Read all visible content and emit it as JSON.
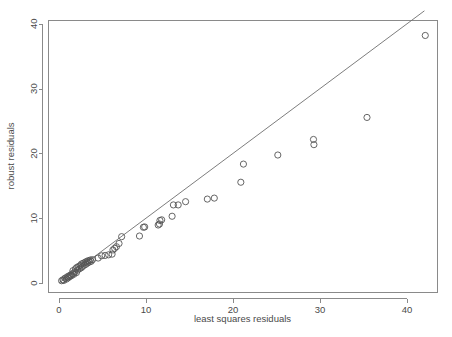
{
  "chart_data": {
    "type": "scatter",
    "title": "",
    "xlabel": "least squares residuals",
    "ylabel": "robust residuals",
    "xlim": [
      -1.5,
      43.5
    ],
    "ylim": [
      -1.2,
      42.0
    ],
    "xticks": [
      0,
      10,
      20,
      30,
      40
    ],
    "yticks": [
      0,
      10,
      20,
      30,
      40
    ],
    "xticklabels": [
      "0",
      "10",
      "20",
      "30",
      "40"
    ],
    "yticklabels": [
      "0",
      "10",
      "20",
      "30",
      "40"
    ],
    "grid": false,
    "legend": null,
    "marker": "open-circle",
    "marker_size": 3.1,
    "series": [
      {
        "name": "residual comparison",
        "points": [
          [
            0.3,
            0.35
          ],
          [
            0.45,
            0.5
          ],
          [
            0.55,
            0.4
          ],
          [
            0.7,
            0.75
          ],
          [
            0.85,
            0.6
          ],
          [
            0.95,
            0.95
          ],
          [
            1.05,
            0.8
          ],
          [
            1.15,
            1.1
          ],
          [
            1.25,
            1.0
          ],
          [
            1.35,
            1.25
          ],
          [
            1.45,
            1.15
          ],
          [
            1.55,
            1.45
          ],
          [
            1.6,
            1.9
          ],
          [
            1.7,
            1.35
          ],
          [
            1.8,
            1.7
          ],
          [
            1.9,
            2.2
          ],
          [
            2.0,
            1.6
          ],
          [
            2.05,
            2.4
          ],
          [
            2.15,
            2.0
          ],
          [
            2.25,
            2.55
          ],
          [
            2.35,
            2.2
          ],
          [
            2.45,
            2.7
          ],
          [
            2.55,
            2.35
          ],
          [
            2.6,
            2.95
          ],
          [
            2.7,
            2.55
          ],
          [
            2.8,
            3.05
          ],
          [
            2.9,
            2.75
          ],
          [
            3.0,
            3.2
          ],
          [
            3.1,
            2.9
          ],
          [
            3.2,
            3.35
          ],
          [
            3.3,
            3.1
          ],
          [
            3.4,
            3.45
          ],
          [
            3.5,
            3.25
          ],
          [
            3.6,
            3.55
          ],
          [
            3.7,
            3.35
          ],
          [
            3.85,
            3.6
          ],
          [
            4.5,
            3.85
          ],
          [
            4.9,
            4.2
          ],
          [
            5.3,
            4.25
          ],
          [
            5.7,
            4.35
          ],
          [
            6.1,
            4.45
          ],
          [
            6.2,
            5.1
          ],
          [
            6.4,
            5.35
          ],
          [
            6.6,
            5.6
          ],
          [
            6.9,
            6.1
          ],
          [
            7.2,
            7.15
          ],
          [
            9.25,
            7.25
          ],
          [
            9.7,
            8.6
          ],
          [
            9.85,
            8.65
          ],
          [
            11.4,
            8.95
          ],
          [
            11.55,
            9.1
          ],
          [
            11.6,
            9.65
          ],
          [
            11.8,
            9.75
          ],
          [
            13.0,
            10.3
          ],
          [
            13.15,
            12.05
          ],
          [
            13.7,
            12.05
          ],
          [
            14.55,
            12.55
          ],
          [
            17.05,
            12.95
          ],
          [
            17.85,
            13.1
          ],
          [
            20.9,
            15.55
          ],
          [
            21.2,
            18.35
          ],
          [
            25.15,
            19.75
          ],
          [
            29.25,
            22.15
          ],
          [
            29.3,
            21.35
          ],
          [
            35.4,
            25.55
          ],
          [
            42.1,
            38.2
          ]
        ]
      }
    ],
    "reference_line": {
      "name": "y = x identity line",
      "from": [
        0.0,
        0.0
      ],
      "to": [
        42.0,
        42.0
      ],
      "slope": 1,
      "intercept": 0
    }
  },
  "plot_geometry": {
    "frame": {
      "left": 48,
      "right": 437,
      "top": 20,
      "bottom": 292
    },
    "x_px_zero": 59,
    "x_px_per_unit": 8.7,
    "y_px_zero": 283,
    "y_px_per_unit": 6.48
  },
  "colors": {
    "background": "#ffffff",
    "axis": "#8a8a8a",
    "point_stroke": "#555555",
    "reference_line": "#6e6e6e",
    "text": "#4a4a4a"
  }
}
